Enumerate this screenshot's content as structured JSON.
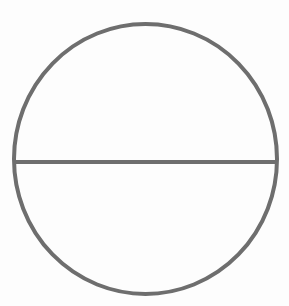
{
  "diagram": {
    "type": "circle-with-diameter",
    "canvas": {
      "width": 289,
      "height": 306,
      "background": "#fdfdfd"
    },
    "circle": {
      "cx": 145.5,
      "cy": 159,
      "rx": 131.5,
      "ry": 135,
      "stroke": "#6e6e6e",
      "stroke_width": 4,
      "fill": "none"
    },
    "diameter": {
      "x1": 15,
      "y1": 162,
      "x2": 276,
      "y2": 162,
      "stroke": "#6e6e6e",
      "stroke_width": 4,
      "orientation": "horizontal"
    }
  }
}
